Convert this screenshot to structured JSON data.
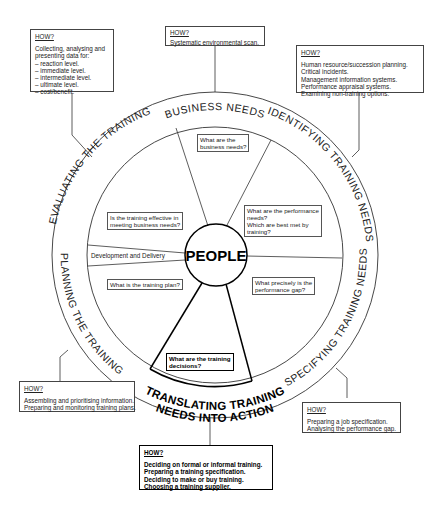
{
  "center": {
    "label": "PEOPLE"
  },
  "stages": {
    "business_needs": "BUSINESS NEEDS",
    "identifying": "IDENTIFYING TRAINING NEEDS",
    "specifying": "SPECIFYING TRAINING NEEDS",
    "translating_line1": "TRANSLATING TRAINING",
    "translating_line2": "NEEDS INTO ACTION",
    "planning": "PLANNING THE TRAINING",
    "evaluating": "EVALUATING THE TRAINING"
  },
  "segment_labels": {
    "development": "Development and Delivery"
  },
  "questions": {
    "business": [
      "What are the",
      "business needs?"
    ],
    "performance": [
      "What are the performance",
      "needs?",
      "Which are best met by",
      "training?"
    ],
    "gap": [
      "What precisely is the",
      "performance gap?"
    ],
    "decisions": [
      "What are the training",
      "decisions?"
    ],
    "plan": [
      "What is the training plan?"
    ],
    "effective": [
      "Is the training effective in",
      "meeting business needs?"
    ]
  },
  "how_boxes": {
    "heading": "HOW?",
    "evaluating": [
      "Collecting, analysing  and",
      "presenting data for:",
      "– reaction level.",
      "– immediate level.",
      "– intermediate level.",
      "– ultimate level.",
      "– cost/benefit."
    ],
    "business": [
      "Systematic environmental scan."
    ],
    "identifying": [
      "Human resource/succession planning.",
      "Critical incidents.",
      "Management information systems.",
      "Performance appraisal systems.",
      "Examining non-training options."
    ],
    "planning": [
      "Assembling and prioritising information.",
      "Preparing and monitoring training plans."
    ],
    "specifying": [
      "Preparing a job specification.",
      "Analysing the performance gap."
    ],
    "translating": [
      "Deciding on formal or informal training.",
      "Preparing a training specification.",
      "Deciding to make or buy training.",
      "Choosing a training supplier."
    ]
  }
}
